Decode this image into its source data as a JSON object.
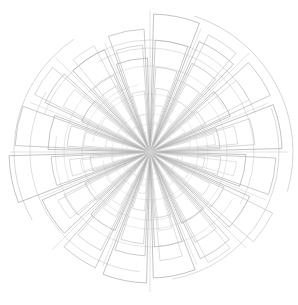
{
  "chart_data": {
    "type": "bar",
    "subtype": "polar-rose-outline",
    "title": "",
    "subtitle": "",
    "xlabel": "",
    "ylabel": "",
    "legend": [],
    "annotations": [],
    "grid": false,
    "axis_labels_visible": false,
    "tick_labels_visible": false,
    "background_color": "#ffffff",
    "center": {
      "x": 150,
      "y": 152
    },
    "sector_count": 16,
    "sector_angle_deg": 22.5,
    "start_angle_deg": -90,
    "rlim": [
      0,
      145
    ],
    "categories": [
      "0",
      "22.5",
      "45",
      "67.5",
      "90",
      "112.5",
      "135",
      "157.5",
      "180",
      "202.5",
      "225",
      "247.5",
      "270",
      "292.5",
      "315",
      "337.5"
    ],
    "series": [
      {
        "name": "series-1",
        "color": "#9a9a9a",
        "stroke_width": 0.6,
        "gap_deg": 3.0,
        "values": [
          138,
          121,
          88,
          132,
          96,
          109,
          78,
          126,
          131,
          86,
          118,
          141,
          102,
          75,
          112,
          94
        ]
      },
      {
        "name": "series-2",
        "color": "#a8a8a8",
        "stroke_width": 0.6,
        "gap_deg": 5.5,
        "values": [
          112,
          98,
          133,
          70,
          126,
          82,
          118,
          95,
          104,
          128,
          72,
          99,
          135,
          116,
          85,
          123
        ]
      },
      {
        "name": "series-3",
        "color": "#b4b4b4",
        "stroke_width": 0.55,
        "gap_deg": 8.0,
        "values": [
          85,
          131,
          62,
          105,
          71,
          137,
          101,
          66,
          92,
          110,
          96,
          60,
          83,
          129,
          74,
          107
        ]
      },
      {
        "name": "series-4",
        "color": "#c0c0c0",
        "stroke_width": 0.55,
        "gap_deg": 10.5,
        "values": [
          64,
          77,
          112,
          88,
          55,
          68,
          125,
          109,
          59,
          73,
          104,
          81,
          67,
          98,
          120,
          61
        ]
      },
      {
        "name": "series-5",
        "color": "#c9c9c9",
        "stroke_width": 0.5,
        "gap_deg": 13.0,
        "values": [
          47,
          58,
          40,
          66,
          87,
          44,
          53,
          79,
          42,
          61,
          50,
          70,
          45,
          56,
          63,
          38
        ]
      },
      {
        "name": "series-6",
        "color": "#d2d2d2",
        "stroke_width": 0.5,
        "gap_deg": 15.5,
        "values": [
          30,
          36,
          25,
          41,
          33,
          28,
          38,
          22,
          34,
          27,
          31,
          39,
          24,
          37,
          29,
          20
        ]
      }
    ],
    "ring_arcs": [
      {
        "r": 143,
        "start_deg": -72,
        "end_deg": 16,
        "color": "#b9b9b9",
        "stroke_width": 0.6
      },
      {
        "r": 136,
        "start_deg": 150,
        "end_deg": 236,
        "color": "#bdbdbd",
        "stroke_width": 0.6
      },
      {
        "r": 129,
        "start_deg": -20,
        "end_deg": 80,
        "color": "#c1c1c1",
        "stroke_width": 0.6
      },
      {
        "r": 120,
        "start_deg": 95,
        "end_deg": 210,
        "color": "#c4c4c4",
        "stroke_width": 0.55
      },
      {
        "r": 112,
        "start_deg": 200,
        "end_deg": 340,
        "color": "#c7c7c7",
        "stroke_width": 0.55
      },
      {
        "r": 104,
        "start_deg": -120,
        "end_deg": 30,
        "color": "#cacaca",
        "stroke_width": 0.55
      },
      {
        "r": 95,
        "start_deg": 30,
        "end_deg": 190,
        "color": "#cdcdcd",
        "stroke_width": 0.5
      },
      {
        "r": 86,
        "start_deg": 160,
        "end_deg": 330,
        "color": "#d0d0d0",
        "stroke_width": 0.5
      },
      {
        "r": 77,
        "start_deg": -70,
        "end_deg": 110,
        "color": "#d3d3d3",
        "stroke_width": 0.5
      },
      {
        "r": 68,
        "start_deg": 70,
        "end_deg": 260,
        "color": "#d5d5d5",
        "stroke_width": 0.5
      },
      {
        "r": 58,
        "start_deg": 190,
        "end_deg": 20,
        "color": "#d8d8d8",
        "stroke_width": 0.5
      },
      {
        "r": 48,
        "start_deg": -40,
        "end_deg": 170,
        "color": "#dadada",
        "stroke_width": 0.5
      },
      {
        "r": 38,
        "start_deg": 110,
        "end_deg": 320,
        "color": "#dcdcdc",
        "stroke_width": 0.5
      },
      {
        "r": 28,
        "start_deg": 0,
        "end_deg": 300,
        "color": "#dedede",
        "stroke_width": 0.5
      }
    ],
    "spokes": [
      {
        "angle_deg": -90,
        "r": 142,
        "color": "#c6c6c6",
        "stroke_width": 0.5
      },
      {
        "angle_deg": -67.5,
        "r": 134,
        "color": "#c8c8c8",
        "stroke_width": 0.5
      },
      {
        "angle_deg": -45,
        "r": 140,
        "color": "#c6c6c6",
        "stroke_width": 0.5
      },
      {
        "angle_deg": -22.5,
        "r": 128,
        "color": "#cacaca",
        "stroke_width": 0.5
      },
      {
        "angle_deg": 0,
        "r": 138,
        "color": "#c6c6c6",
        "stroke_width": 0.5
      },
      {
        "angle_deg": 22.5,
        "r": 126,
        "color": "#cacaca",
        "stroke_width": 0.5
      },
      {
        "angle_deg": 45,
        "r": 136,
        "color": "#c6c6c6",
        "stroke_width": 0.5
      },
      {
        "angle_deg": 67.5,
        "r": 122,
        "color": "#cacaca",
        "stroke_width": 0.5
      },
      {
        "angle_deg": 90,
        "r": 140,
        "color": "#c6c6c6",
        "stroke_width": 0.5
      },
      {
        "angle_deg": 112.5,
        "r": 124,
        "color": "#cacaca",
        "stroke_width": 0.5
      },
      {
        "angle_deg": 135,
        "r": 138,
        "color": "#c6c6c6",
        "stroke_width": 0.5
      },
      {
        "angle_deg": 157.5,
        "r": 120,
        "color": "#cacaca",
        "stroke_width": 0.5
      },
      {
        "angle_deg": 180,
        "r": 140,
        "color": "#c6c6c6",
        "stroke_width": 0.5
      },
      {
        "angle_deg": 202.5,
        "r": 130,
        "color": "#cacaca",
        "stroke_width": 0.5
      },
      {
        "angle_deg": 225,
        "r": 134,
        "color": "#c6c6c6",
        "stroke_width": 0.5
      },
      {
        "angle_deg": 247.5,
        "r": 118,
        "color": "#cacaca",
        "stroke_width": 0.5
      }
    ]
  }
}
